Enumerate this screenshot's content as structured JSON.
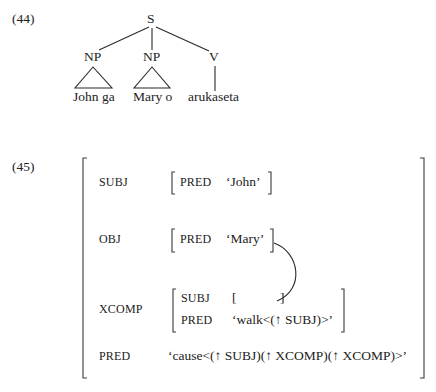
{
  "example_44": {
    "number": "(44)",
    "tree": {
      "root": "S",
      "children": [
        {
          "label": "NP",
          "leaf": "John ga",
          "type": "triangle"
        },
        {
          "label": "NP",
          "leaf": "Mary o",
          "type": "triangle"
        },
        {
          "label": "V",
          "leaf": "arukaseta",
          "type": "line"
        }
      ]
    }
  },
  "example_45": {
    "number": "(45)",
    "fstructure": {
      "subj": {
        "attr": "SUBJ",
        "pred_attr": "PRED",
        "pred_value": "‘John’"
      },
      "obj": {
        "attr": "OBJ",
        "pred_attr": "PRED",
        "pred_value": "‘Mary’"
      },
      "xcomp": {
        "attr": "XCOMP",
        "subj_attr": "SUBJ",
        "subj_open": "[",
        "subj_close": "]",
        "pred_attr": "PRED",
        "pred_value": "‘walk<(↑ SUBJ)>’"
      },
      "pred": {
        "attr": "PRED",
        "value": "‘cause<(↑ SUBJ)(↑ XCOMP)(↑ XCOMP)>’"
      }
    }
  }
}
